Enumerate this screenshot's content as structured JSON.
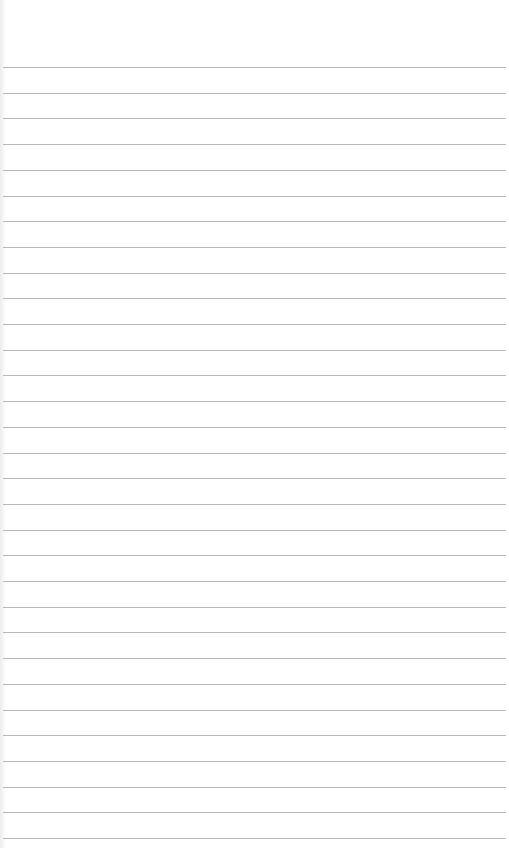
{
  "page": {
    "type": "ruled-notepad-page",
    "background_color": "#ffffff",
    "line_color": "#b8b8b8",
    "header_text": "",
    "line_count": 31,
    "first_line_y": 67,
    "line_spacing": 25.7,
    "line_left": 3,
    "line_right": 506
  }
}
